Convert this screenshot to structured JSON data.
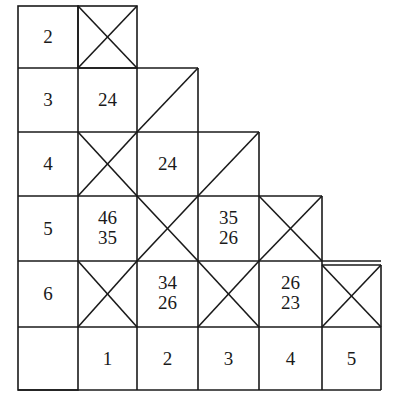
{
  "grid": {
    "columns": [
      18,
      78,
      137,
      198,
      259,
      322,
      381
    ],
    "rows": [
      6,
      68,
      132,
      196,
      261,
      327,
      390
    ]
  },
  "row_labels": [
    "2",
    "3",
    "4",
    "5",
    "6"
  ],
  "col_labels": [
    "1",
    "2",
    "3",
    "4",
    "5"
  ],
  "cells": {
    "r3c1": "24",
    "r4c2": "24",
    "r5c1_top": "46",
    "r5c1_bot": "35",
    "r5c3_top": "35",
    "r5c3_bot": "26",
    "r6c2_top": "34",
    "r6c2_bot": "26",
    "r6c4_top": "26",
    "r6c4_bot": "23"
  },
  "crossed_cells": [
    "r2c1",
    "r4c1",
    "r5c2",
    "r5c4",
    "r6c1",
    "r6c3",
    "r6c5"
  ],
  "diagonal_cells": [
    "r3c2",
    "r4c3"
  ],
  "colors": {
    "line": "#1a1a1a",
    "background": "#ffffff"
  }
}
